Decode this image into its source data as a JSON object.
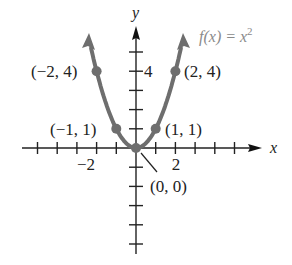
{
  "chart_data": {
    "type": "line",
    "title": "",
    "xlabel": "x",
    "ylabel": "y",
    "function_label": "f(x) = x^2",
    "function_label_base": "f(x) = x",
    "function_label_exp": "2",
    "xlim": [
      -5,
      6
    ],
    "ylim": [
      -6,
      6
    ],
    "x_tick_labels": [
      {
        "value": -2,
        "label": "−2"
      },
      {
        "value": 2,
        "label": "2"
      }
    ],
    "y_tick_labels": [
      {
        "value": 4,
        "label": "4"
      }
    ],
    "series": [
      {
        "name": "f(x) = x^2",
        "color": "#6e6e6e",
        "x": [
          -2,
          -1,
          0,
          1,
          2
        ],
        "y": [
          4,
          1,
          0,
          1,
          4
        ]
      }
    ],
    "annotations": [
      {
        "point": [
          -2,
          4
        ],
        "label": "(−2, 4)"
      },
      {
        "point": [
          -1,
          1
        ],
        "label": "(−1, 1)"
      },
      {
        "point": [
          0,
          0
        ],
        "label": "(0, 0)"
      },
      {
        "point": [
          1,
          1
        ],
        "label": "(1, 1)"
      },
      {
        "point": [
          2,
          4
        ],
        "label": "(2, 4)"
      }
    ],
    "grid": false,
    "legend": "none"
  }
}
